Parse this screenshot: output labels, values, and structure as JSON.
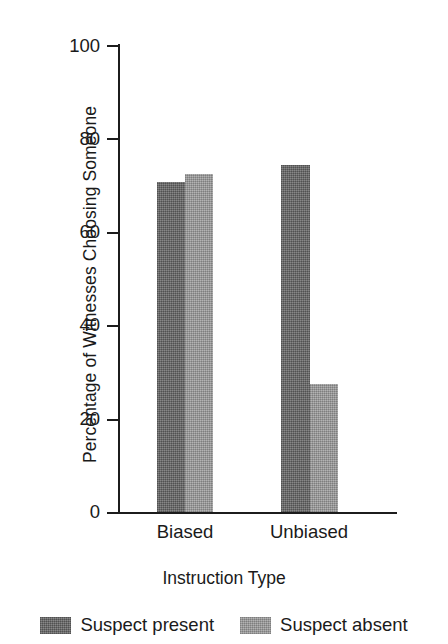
{
  "chart_data": {
    "type": "bar",
    "title": "",
    "subtitle": "",
    "xlabel": "Instruction Type",
    "ylabel": "Percentage of Witnesses Choosing Someone",
    "categories": [
      "Biased",
      "Unbiased"
    ],
    "series": [
      {
        "name": "Suspect present",
        "values": [
          77,
          81
        ],
        "color": "#6b6b6b"
      },
      {
        "name": "Suspect absent",
        "values": [
          79,
          30
        ],
        "color": "#9c9c9c"
      }
    ],
    "ylim": [
      0,
      100
    ],
    "yticks": [
      0,
      20,
      40,
      60,
      80,
      100
    ],
    "ytick_labels": [
      "0",
      "20",
      "40",
      "60",
      "80",
      "100"
    ],
    "grid": false,
    "legend_position": "bottom",
    "annotations": []
  },
  "axes": {
    "y_title": "Percentage of Witnesses Choosing Someone",
    "x_title": "Instruction Type",
    "y_ticks": [
      "100",
      "80",
      "60",
      "40",
      "20",
      "0"
    ],
    "x_ticks": [
      "Biased",
      "Unbiased"
    ]
  },
  "legend": {
    "entries": [
      {
        "label": "Suspect present",
        "color": "#6b6b6b"
      },
      {
        "label": "Suspect absent",
        "color": "#9c9c9c"
      }
    ]
  }
}
